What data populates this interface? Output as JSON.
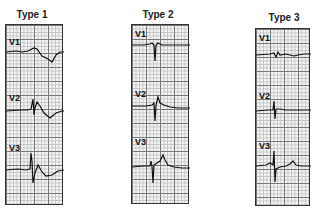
{
  "figure": {
    "panels": [
      {
        "title": "Type 1",
        "leads": [
          "V1",
          "V2",
          "V3"
        ]
      },
      {
        "title": "Type 2",
        "leads": [
          "V1",
          "V2",
          "V3"
        ]
      },
      {
        "title": "Type 3",
        "leads": [
          "V1",
          "V2",
          "V3"
        ]
      }
    ]
  }
}
